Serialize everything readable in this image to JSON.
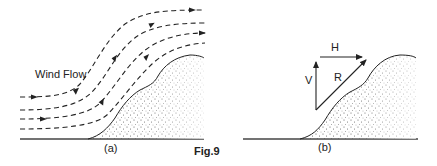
{
  "figure": {
    "caption": "Fig.9",
    "panels": [
      {
        "id": "a",
        "label": "(a)",
        "annotation": "Wind Flow",
        "description": "Dashed wind streamlines flowing left to right, deflected upward over a sand dune slope"
      },
      {
        "id": "b",
        "label": "(b)",
        "vectors": {
          "horizontal": "H",
          "vertical": "V",
          "resultant": "R"
        },
        "description": "Vector triangle: vertical component V and horizontal component H combine into resultant R parallel to the dune slope"
      }
    ]
  },
  "colors": {
    "ink": "#222222",
    "background": "#ffffff",
    "stipple": "#444444"
  }
}
